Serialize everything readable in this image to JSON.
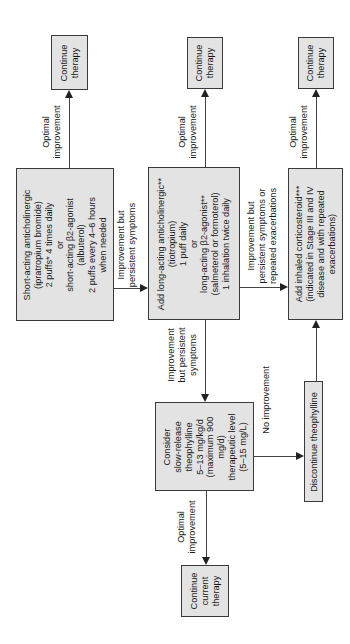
{
  "diagram": {
    "orientation": "rotated-90-ccw",
    "nodes": {
      "short_acting": {
        "lines": [
          "Short-acting anticholinergic",
          "(ipratropium bromide)",
          "2 puffs* 4 times daily",
          "or",
          "short-acting β2-agonist",
          "(albuterol)",
          "2 puffs every 4–6 hours",
          "when needed"
        ]
      },
      "long_acting": {
        "lines": [
          "Add long-acting anticholinergic**",
          "(tiotropium)",
          "1 puff daily",
          "or",
          "long-acting β2-agonist**",
          "(salmeterol or formoterol)",
          "1 inhalation twice daily"
        ]
      },
      "inhaled_corticosteroid": {
        "lines": [
          "Add inhaled corticosteroid***",
          "(indicated in Stage III and IV",
          "disease and with repeated",
          "exacerbations)"
        ]
      },
      "theophylline": {
        "lines": [
          "Consider",
          "slow-release",
          "theophylline",
          "5–13 mg/kg/d",
          "(maximum 900",
          "mg/d)",
          "therapeutic level",
          "(5–15 mg/L)"
        ]
      },
      "discontinue": {
        "lines": [
          "Discontinue theophylline"
        ]
      },
      "continue_1": {
        "lines": [
          "Continue",
          "therapy"
        ]
      },
      "continue_2": {
        "lines": [
          "Continue",
          "therapy"
        ]
      },
      "continue_3": {
        "lines": [
          "Continue",
          "therapy"
        ]
      },
      "continue_current": {
        "lines": [
          "Continue",
          "current",
          "therapy"
        ]
      }
    },
    "edges": {
      "opt1": {
        "lines": [
          "Optimal",
          "improvement"
        ]
      },
      "opt2": {
        "lines": [
          "Optimal",
          "improvement"
        ]
      },
      "opt3": {
        "lines": [
          "Optimal",
          "improvement"
        ]
      },
      "opt4": {
        "lines": [
          "Optimal",
          "improvement"
        ]
      },
      "persist1": {
        "lines": [
          "Improvement  but",
          "persistent symptoms"
        ]
      },
      "persist2": {
        "lines": [
          "Improvement  but",
          "persistent symptoms or",
          "repeated exacerbations"
        ]
      },
      "persist3": {
        "lines": [
          "Improvement",
          "but persistent",
          "symptoms"
        ]
      },
      "no_improvement": {
        "lines": [
          "No improvement"
        ]
      }
    },
    "colors": {
      "box_fill": "#e3e3e3",
      "box_border": "#3a3a3a",
      "line": "#444444",
      "background": "#ffffff"
    }
  }
}
